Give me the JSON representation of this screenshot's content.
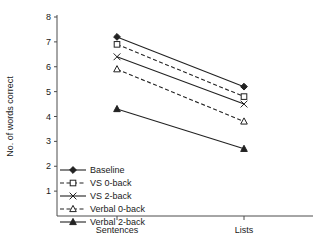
{
  "chart_data": {
    "type": "line",
    "title": "",
    "xlabel": "",
    "ylabel": "No. of words correct",
    "categories": [
      "Sentences",
      "Lists"
    ],
    "ylim": [
      0,
      8
    ],
    "yticks": [
      0,
      1,
      2,
      3,
      4,
      5,
      6,
      7,
      8
    ],
    "ytick_labels": [
      "",
      "1",
      "2",
      "3",
      "4",
      "5",
      "6",
      "7",
      "8"
    ],
    "grid": false,
    "legend_position": "lower-left-inside",
    "series": [
      {
        "name": "Baseline",
        "values": [
          7.2,
          5.2
        ],
        "line": "solid",
        "marker": "filled-diamond"
      },
      {
        "name": "VS 0-back",
        "values": [
          6.9,
          4.8
        ],
        "line": "dashed",
        "marker": "open-square"
      },
      {
        "name": "VS 2-back",
        "values": [
          6.4,
          4.5
        ],
        "line": "solid",
        "marker": "cross-x"
      },
      {
        "name": "Verbal 0-back",
        "values": [
          5.9,
          3.8
        ],
        "line": "dashed",
        "marker": "open-triangle"
      },
      {
        "name": "Verbal 2-back",
        "values": [
          4.3,
          2.7
        ],
        "line": "solid",
        "marker": "filled-triangle"
      }
    ]
  }
}
